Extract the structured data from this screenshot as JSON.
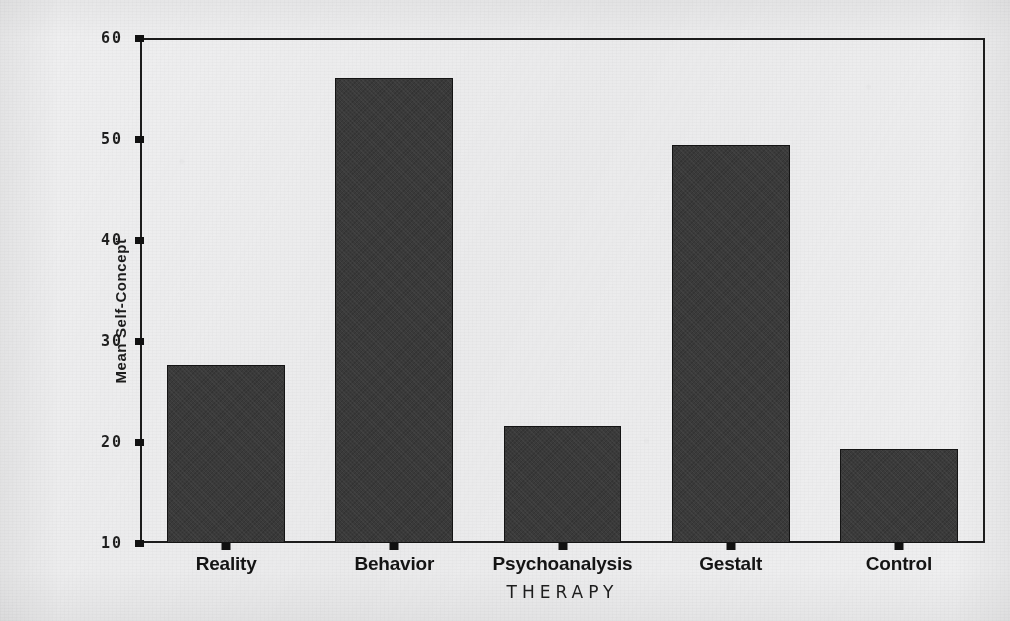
{
  "chart_data": {
    "type": "bar",
    "title": "",
    "subtitle": "",
    "categories": [
      "Reality",
      "Behavior",
      "Psychoanalysis",
      "Gestalt",
      "Control"
    ],
    "values": [
      27.7,
      56.2,
      21.6,
      49.6,
      19.3
    ],
    "series": [
      {
        "name": "Mean Self-Concept",
        "values": [
          27.7,
          56.2,
          21.6,
          49.6,
          19.3
        ]
      }
    ],
    "xlabel": "THERAPY",
    "ylabel": "Mean Self-Concept",
    "ylim": [
      10,
      60
    ],
    "yticks": [
      10,
      20,
      30,
      40,
      50,
      60
    ],
    "ytick_labels": [
      "10",
      "20",
      "30",
      "40",
      "50",
      "60"
    ],
    "xtick_labels": [
      "Reality",
      "Behavior",
      "Psychoanalysis",
      "Gestalt",
      "Control"
    ],
    "grid": false,
    "legend": false,
    "legend_position": "none",
    "bar_color": "#3b3b3b",
    "bar_edge_color": "#141414",
    "axis_color": "#1c1c1c",
    "background_color": "#efeff0",
    "annotations": []
  },
  "figure": {
    "y_axis_title": "Mean Self-Concept",
    "x_axis_title": "THERAPY"
  }
}
